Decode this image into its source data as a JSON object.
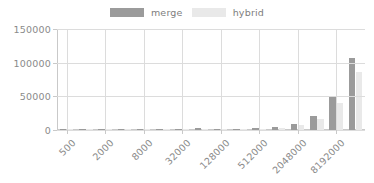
{
  "chart_data": {
    "type": "bar",
    "title": "",
    "xlabel": "",
    "ylabel": "",
    "ylim": [
      0,
      150000
    ],
    "ytick_labels": [
      "0",
      "50000",
      "100000",
      "150000"
    ],
    "ytick_values": [
      0,
      50000,
      100000,
      150000
    ],
    "grid": true,
    "legend_position": "top-center",
    "categories": [
      "500",
      "1000",
      "2000",
      "4000",
      "8000",
      "16000",
      "32000",
      "64000",
      "128000",
      "256000",
      "512000",
      "1024000",
      "2048000",
      "4096000",
      "8192000",
      "16384000"
    ],
    "xtick_labels": [
      "500",
      "2000",
      "8000",
      "32000",
      "128000",
      "512000",
      "2048000",
      "8192000"
    ],
    "xtick_category_indices": [
      0,
      2,
      4,
      6,
      8,
      10,
      12,
      14
    ],
    "series": [
      {
        "name": "merge",
        "color": "#9b9b9b",
        "values": [
          20,
          40,
          80,
          160,
          320,
          650,
          1300,
          2600,
          800,
          1300,
          2400,
          4200,
          9500,
          21000,
          50000,
          107000
        ]
      },
      {
        "name": "hybrid",
        "color": "#e9e9e9",
        "values": [
          18,
          35,
          70,
          140,
          280,
          560,
          1100,
          2200,
          700,
          1100,
          2000,
          3400,
          7000,
          16500,
          40000,
          86000
        ]
      }
    ]
  },
  "legend": {
    "items": [
      {
        "label": "merge",
        "color": "#9b9b9b"
      },
      {
        "label": "hybrid",
        "color": "#e9e9e9"
      }
    ]
  },
  "colors": {
    "merge": "#9b9b9b",
    "hybrid": "#e9e9e9",
    "grid": "#dcdcdc",
    "axis": "#c9c9c9",
    "text": "#8a8a8a",
    "background": "#ffffff"
  }
}
